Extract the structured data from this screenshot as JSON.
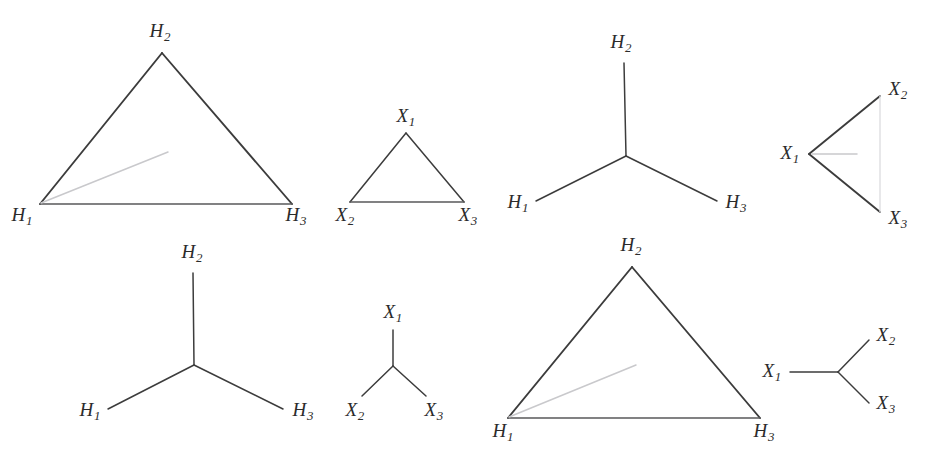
{
  "page": {
    "background": "#ffffff",
    "stroke_color": "#3c3c3c",
    "hint_color": "#c9c9cc",
    "width": 926,
    "height": 475
  },
  "figures": [
    {
      "id": "fig-1",
      "name": "large-triangle-H-top-left",
      "shape": "triangle",
      "labels": [
        {
          "base": "H",
          "sub": "1",
          "x": 22,
          "y": 216
        },
        {
          "base": "H",
          "sub": "2",
          "x": 160,
          "y": 32
        },
        {
          "base": "H",
          "sub": "3",
          "x": 296,
          "y": 216
        }
      ]
    },
    {
      "id": "fig-2",
      "name": "small-triangle-X-top",
      "shape": "triangle",
      "labels": [
        {
          "base": "X",
          "sub": "1",
          "x": 406,
          "y": 117
        },
        {
          "base": "X",
          "sub": "2",
          "x": 345,
          "y": 216
        },
        {
          "base": "X",
          "sub": "3",
          "x": 468,
          "y": 216
        }
      ]
    },
    {
      "id": "fig-3",
      "name": "tripod-H-top",
      "shape": "tripod",
      "labels": [
        {
          "base": "H",
          "sub": "1",
          "x": 518,
          "y": 203
        },
        {
          "base": "H",
          "sub": "2",
          "x": 621,
          "y": 43
        },
        {
          "base": "H",
          "sub": "3",
          "x": 736,
          "y": 203
        }
      ]
    },
    {
      "id": "fig-4",
      "name": "rotated-triangle-X-top-right",
      "shape": "triangle-rotated",
      "labels": [
        {
          "base": "X",
          "sub": "1",
          "x": 790,
          "y": 154
        },
        {
          "base": "X",
          "sub": "2",
          "x": 898,
          "y": 90
        },
        {
          "base": "X",
          "sub": "3",
          "x": 898,
          "y": 219
        }
      ]
    },
    {
      "id": "fig-5",
      "name": "tripod-H-bottom",
      "shape": "tripod",
      "labels": [
        {
          "base": "H",
          "sub": "1",
          "x": 90,
          "y": 411
        },
        {
          "base": "H",
          "sub": "2",
          "x": 192,
          "y": 253
        },
        {
          "base": "H",
          "sub": "3",
          "x": 303,
          "y": 411
        }
      ]
    },
    {
      "id": "fig-6",
      "name": "small-tripod-X-bottom",
      "shape": "tripod",
      "labels": [
        {
          "base": "X",
          "sub": "1",
          "x": 393,
          "y": 313
        },
        {
          "base": "X",
          "sub": "2",
          "x": 355,
          "y": 411
        },
        {
          "base": "X",
          "sub": "3",
          "x": 434,
          "y": 411
        }
      ]
    },
    {
      "id": "fig-7",
      "name": "large-triangle-H-bottom",
      "shape": "triangle",
      "labels": [
        {
          "base": "H",
          "sub": "1",
          "x": 503,
          "y": 432
        },
        {
          "base": "H",
          "sub": "2",
          "x": 631,
          "y": 246
        },
        {
          "base": "H",
          "sub": "3",
          "x": 764,
          "y": 432
        }
      ]
    },
    {
      "id": "fig-8",
      "name": "rotated-tripod-X-bottom-right",
      "shape": "tripod-rotated",
      "labels": [
        {
          "base": "X",
          "sub": "1",
          "x": 772,
          "y": 372
        },
        {
          "base": "X",
          "sub": "2",
          "x": 886,
          "y": 336
        },
        {
          "base": "X",
          "sub": "3",
          "x": 886,
          "y": 404
        }
      ]
    }
  ]
}
